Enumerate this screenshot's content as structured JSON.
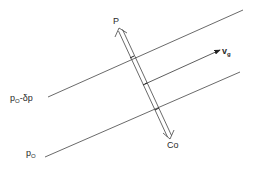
{
  "diagram": {
    "labels": {
      "p_top": "P",
      "co_bottom": "Co",
      "vg_base": "v",
      "vg_sub": "g",
      "isobar_upper_base": "p",
      "isobar_upper_sub": "O",
      "isobar_upper_suffix": "-δp",
      "isobar_lower_base": "p",
      "isobar_lower_sub": "O"
    },
    "elements": [
      {
        "type": "line",
        "name": "isobar-p0-minus-dp",
        "from": [
          48,
          97
        ],
        "to": [
          243,
          10
        ]
      },
      {
        "type": "line",
        "name": "isobar-p0",
        "from": [
          45,
          157
        ],
        "to": [
          240,
          72
        ]
      },
      {
        "type": "arrow",
        "name": "geostrophic-wind-vg",
        "from": [
          145,
          84
        ],
        "to": [
          220,
          50
        ]
      },
      {
        "type": "double-arrow-tube",
        "name": "pressure-coriolis-axis",
        "from": [
          120,
          28
        ],
        "to": [
          170,
          138
        ]
      }
    ],
    "colors": {
      "line": "#333333",
      "background": "#ffffff"
    }
  }
}
